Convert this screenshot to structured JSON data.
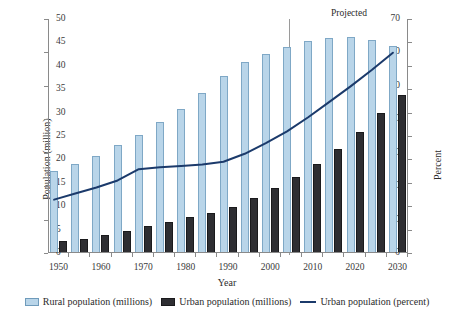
{
  "chart_data": {
    "type": "bar",
    "title": "",
    "xlabel": "Year",
    "ylabel": "Population (million)",
    "y2label": "Percent",
    "ylim": [
      0,
      70
    ],
    "y2lim": [
      0,
      50
    ],
    "grid": false,
    "legend_position": "bottom",
    "categories": [
      1950,
      1955,
      1960,
      1965,
      1970,
      1975,
      1980,
      1985,
      1990,
      1995,
      2000,
      2005,
      2010,
      2015,
      2020,
      2025,
      2030
    ],
    "x_tick_labels": [
      "1950",
      "1960",
      "1970",
      "1980",
      "1990",
      "2000",
      "2010",
      "2020",
      "2030"
    ],
    "y_tick_labels": [
      "0",
      "10",
      "20",
      "30",
      "40",
      "50",
      "60",
      "70"
    ],
    "y2_tick_labels": [
      "0",
      "5",
      "10",
      "15",
      "20",
      "25",
      "30",
      "35",
      "40",
      "45",
      "50"
    ],
    "series": [
      {
        "name": "Rural population (millions)",
        "type": "bar",
        "axis": "left",
        "color": "#b9d5e9",
        "edge_color": "#7fa8c6",
        "values": [
          24.2,
          26.2,
          28.7,
          31.9,
          35.1,
          39.0,
          42.7,
          47.6,
          52.7,
          56.8,
          59.3,
          61.4,
          63.1,
          64.1,
          64.4,
          63.5,
          61.6
        ]
      },
      {
        "name": "Urban population (millions)",
        "type": "bar",
        "axis": "left",
        "color": "#2e2e32",
        "edge_color": "#1a1a1c",
        "values": [
          3.3,
          3.9,
          5.0,
          6.2,
          7.9,
          9.1,
          10.4,
          11.7,
          13.5,
          16.2,
          19.2,
          22.5,
          26.4,
          30.9,
          36.0,
          41.5,
          47.1
        ]
      },
      {
        "name": "Urban population (percent)",
        "type": "line",
        "axis": "right",
        "color": "#1b3a6b",
        "values": [
          11.4,
          12.7,
          14.0,
          15.5,
          17.9,
          18.3,
          18.6,
          18.9,
          19.5,
          21.2,
          23.5,
          26.0,
          29.0,
          32.3,
          35.6,
          39.1,
          42.8
        ]
      }
    ],
    "annotations": [
      {
        "name": "projected",
        "label": "Projected",
        "start_year": 2005,
        "end_year": 2030,
        "style": "double-headed-arrow"
      }
    ]
  },
  "legend": {
    "items": [
      {
        "label": "Rural population (millions)",
        "marker": "square-light-blue"
      },
      {
        "label": "Urban population (millions)",
        "marker": "square-dark"
      },
      {
        "label": "Urban population (percent)",
        "marker": "line-navy"
      }
    ]
  },
  "axes": {
    "x_title": "Year",
    "y_left_title": "Population (million)",
    "y_right_title": "Percent"
  },
  "colors": {
    "rural_fill": "#b9d5e9",
    "rural_edge": "#7fa8c6",
    "urban_fill": "#2e2e32",
    "urban_edge": "#1a1a1c",
    "line": "#1b3a6b",
    "axis": "#8a8a8a",
    "text": "#2b2b2b",
    "background": "#ffffff"
  }
}
